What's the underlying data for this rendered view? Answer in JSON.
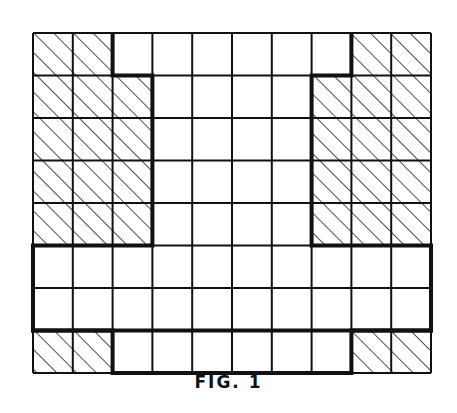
{
  "figure": {
    "caption": "FIG. 1",
    "grid": {
      "columns": 10,
      "rows": 8,
      "left": 33,
      "top": 33,
      "right": 431,
      "bottom": 373,
      "line_color": "#111111",
      "hatch_color": "#222222"
    },
    "hatched_cells": [
      [
        0,
        0
      ],
      [
        0,
        1
      ],
      [
        0,
        8
      ],
      [
        0,
        9
      ],
      [
        1,
        0
      ],
      [
        1,
        1
      ],
      [
        1,
        2
      ],
      [
        1,
        7
      ],
      [
        1,
        8
      ],
      [
        1,
        9
      ],
      [
        2,
        0
      ],
      [
        2,
        1
      ],
      [
        2,
        2
      ],
      [
        2,
        7
      ],
      [
        2,
        8
      ],
      [
        2,
        9
      ],
      [
        3,
        0
      ],
      [
        3,
        1
      ],
      [
        3,
        2
      ],
      [
        3,
        7
      ],
      [
        3,
        8
      ],
      [
        3,
        9
      ],
      [
        4,
        0
      ],
      [
        4,
        1
      ],
      [
        4,
        2
      ],
      [
        4,
        7
      ],
      [
        4,
        8
      ],
      [
        4,
        9
      ],
      [
        7,
        0
      ],
      [
        7,
        1
      ],
      [
        7,
        8
      ],
      [
        7,
        9
      ]
    ],
    "bold_outline": [
      [
        2,
        0
      ],
      [
        2,
        1
      ],
      [
        3,
        1
      ],
      [
        3,
        5
      ],
      [
        0,
        5
      ],
      [
        0,
        7
      ],
      [
        10,
        7
      ],
      [
        10,
        5
      ],
      [
        7,
        5
      ],
      [
        7,
        1
      ],
      [
        8,
        1
      ],
      [
        8,
        0
      ]
    ],
    "bold_outline_bottom": [
      [
        0,
        5
      ],
      [
        0,
        7
      ],
      [
        2,
        7
      ],
      [
        2,
        8
      ],
      [
        8,
        8
      ],
      [
        8,
        7
      ],
      [
        10,
        7
      ],
      [
        10,
        5
      ]
    ]
  }
}
